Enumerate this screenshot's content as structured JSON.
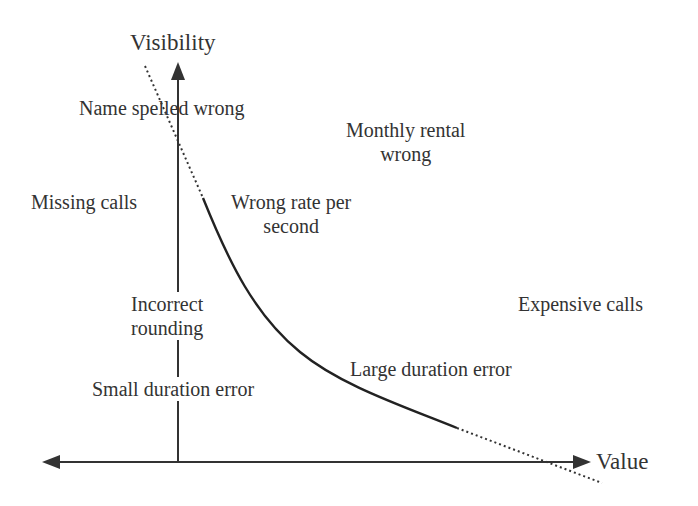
{
  "diagram": {
    "type": "conceptual value-vs-visibility plot",
    "axes": {
      "y_label": "Visibility",
      "x_label": "Value"
    },
    "colors": {
      "ink": "#333333",
      "background": "#ffffff"
    },
    "curve": {
      "description": "Decreasing convex curve: solid in the middle, dotted extensions at both ends",
      "style_ends": "dotted",
      "style_middle": "solid"
    },
    "labels": {
      "name_spelled_wrong": "Name spelled wrong",
      "monthly_rental_line1": "Monthly rental",
      "monthly_rental_line2": "wrong",
      "missing_calls": "Missing calls",
      "wrong_rate_line1": "Wrong rate per",
      "wrong_rate_line2": "second",
      "incorrect_rounding_line1": "Incorrect",
      "incorrect_rounding_line2": "rounding",
      "expensive_calls": "Expensive calls",
      "large_duration_error": "Large duration error",
      "small_duration_error": "Small duration error"
    }
  }
}
